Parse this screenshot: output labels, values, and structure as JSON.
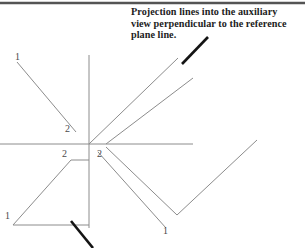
{
  "figure": {
    "type": "engineering-drawing",
    "title_annotation": "Projection lines into the auxiliary\nview perpendicular to the reference\nplane line.",
    "background_color": "#ffffff",
    "line_color": "#8c8c8c",
    "pointer_color": "#141414",
    "border_color": "#545454"
  },
  "labels": {
    "top_left_1": "1",
    "mid_left_2": "2",
    "lower_left_2": "2",
    "lower_left_1": "1",
    "center_right_2": "2",
    "lower_right_1": "1"
  },
  "geometry": {
    "top_border": {
      "x1": 0,
      "y1": 3,
      "x2": 305,
      "y2": 3
    },
    "vertical_axis": {
      "x1": 89,
      "y1": 55,
      "x2": 89,
      "y2": 228
    },
    "horizontal_axis": {
      "x1": 0,
      "y1": 144,
      "x2": 193,
      "y2": 144
    },
    "upper_left_edge": {
      "x1": 17,
      "y1": 62,
      "x2": 76,
      "y2": 132
    },
    "lower_left_triangle": {
      "apex": {
        "x": 13,
        "y": 225
      },
      "top": {
        "x": 71,
        "y": 160
      },
      "corner_top_right": {
        "x": 89,
        "y": 160
      },
      "corner_bottom_right": {
        "x": 89,
        "y": 225
      }
    },
    "aux_projection_upper": {
      "x1": 89,
      "y1": 144,
      "x2": 178,
      "y2": 58
    },
    "aux_projection_lower": {
      "x1": 106,
      "y1": 144,
      "x2": 193,
      "y2": 78
    },
    "aux_vee_upper": {
      "x1": 106,
      "y1": 147,
      "x2": 177,
      "y2": 215
    },
    "aux_vee_lower": {
      "x1": 98,
      "y1": 152,
      "x2": 166,
      "y2": 228
    },
    "aux_vee_right_arm": {
      "x1": 177,
      "y1": 215,
      "x2": 257,
      "y2": 140
    },
    "pointer_top": {
      "x1": 182,
      "y1": 64,
      "x2": 208,
      "y2": 37
    },
    "pointer_bottom": {
      "x1": 71,
      "y1": 221,
      "x2": 93,
      "y2": 248
    }
  }
}
